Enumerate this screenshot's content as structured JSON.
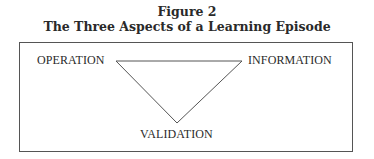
{
  "figure": {
    "number": "Figure 2",
    "title": "The Three Aspects of a Learning Episode"
  },
  "diagram": {
    "shape": "inverted-triangle",
    "nodes": [
      {
        "id": "operation",
        "label": "OPERATION",
        "position": "top-left"
      },
      {
        "id": "information",
        "label": "INFORMATION",
        "position": "top-right"
      },
      {
        "id": "validation",
        "label": "VALIDATION",
        "position": "bottom"
      }
    ],
    "edges": [
      [
        "operation",
        "information"
      ],
      [
        "information",
        "validation"
      ],
      [
        "validation",
        "operation"
      ]
    ],
    "line_color": "#555555"
  }
}
